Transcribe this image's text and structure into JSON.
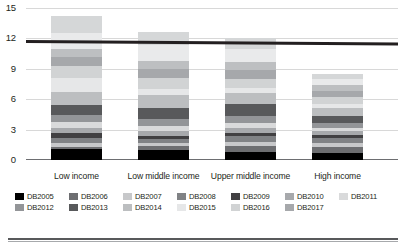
{
  "chart_data": {
    "type": "bar",
    "subtype": "stacked-bar",
    "title": "",
    "xlabel": "",
    "ylabel": "",
    "ylim": [
      0,
      15
    ],
    "yticks": [
      0,
      3,
      6,
      9,
      12,
      15
    ],
    "ytick_labels": [
      "0",
      "3",
      "6",
      "9",
      "12",
      "15"
    ],
    "grid": true,
    "legend_position": "bottom",
    "categories": [
      "Low income",
      "Low middle income",
      "Upper middle income",
      "High income"
    ],
    "series": [
      {
        "name": "DB2005",
        "color": "#000000",
        "values": [
          1.1,
          0.95,
          0.8,
          0.7
        ]
      },
      {
        "name": "DB2006",
        "color": "#6d6e71",
        "values": [
          0.2,
          0.45,
          0.6,
          0.55
        ]
      },
      {
        "name": "DB2007",
        "color": "#c7c8ca",
        "values": [
          0.4,
          0.25,
          0.35,
          0.45
        ]
      },
      {
        "name": "DB2008",
        "color": "#808285",
        "values": [
          0.5,
          0.4,
          0.6,
          0.45
        ]
      },
      {
        "name": "DB2009",
        "color": "#414042",
        "values": [
          0.5,
          0.35,
          0.35,
          0.3
        ]
      },
      {
        "name": "DB2010",
        "color": "#a7a9ac",
        "values": [
          0.5,
          0.45,
          0.5,
          0.4
        ]
      },
      {
        "name": "DB2011",
        "color": "#d9dadb",
        "values": [
          0.55,
          0.5,
          0.5,
          0.35
        ]
      },
      {
        "name": "DB2012",
        "color": "#939598",
        "values": [
          0.7,
          0.75,
          0.65,
          0.5
        ]
      },
      {
        "name": "DB2013",
        "color": "#58595b",
        "values": [
          0.95,
          1.05,
          1.2,
          0.65
        ]
      },
      {
        "name": "DB2014",
        "color": "#bcbec0",
        "values": [
          1.35,
          1.3,
          1.1,
          0.75
        ]
      },
      {
        "name": "DB2015",
        "color": "#e6e7e8",
        "values": [
          1.35,
          0.55,
          0.45,
          0.4
        ]
      },
      {
        "name": "DB2016",
        "color": "#d1d3d4",
        "values": [
          1.2,
          1.1,
          0.95,
          0.75
        ]
      },
      {
        "name": "DB2017",
        "color": "#a6a8ab",
        "values": [
          0.85,
          0.85,
          0.85,
          0.6
        ]
      },
      {
        "name": "DB2018",
        "color": "#bdbfc1",
        "values": [
          0.85,
          0.85,
          0.75,
          0.55
        ]
      },
      {
        "name": "DB2019",
        "color": "#e9eaeb",
        "values": [
          1.55,
          1.6,
          1.35,
          0.65
        ]
      },
      {
        "name": "DB2020",
        "color": "#d5d7d8",
        "values": [
          1.65,
          1.25,
          1.05,
          0.45
        ]
      }
    ],
    "totals": [
      14.25,
      13.65,
      12.75,
      8.0
    ],
    "reference_line": {
      "label": "",
      "value_start": 11.85,
      "value_end": 11.6,
      "color": "#231f20"
    }
  },
  "legend": {
    "rows": [
      [
        {
          "label": "DB2005",
          "color": "#000000"
        },
        {
          "label": "DB2006",
          "color": "#6d6e71"
        },
        {
          "label": "DB2007",
          "color": "#c7c8ca"
        },
        {
          "label": "DB2008",
          "color": "#808285"
        },
        {
          "label": "DB2009",
          "color": "#414042"
        },
        {
          "label": "DB2010",
          "color": "#a7a9ac"
        },
        {
          "label": "DB2011",
          "color": "#d9dadb"
        }
      ],
      [
        {
          "label": "DB2012",
          "color": "#939598"
        },
        {
          "label": "DB2013",
          "color": "#58595b"
        },
        {
          "label": "DB2014",
          "color": "#bcbec0"
        },
        {
          "label": "DB2015",
          "color": "#e6e7e8"
        },
        {
          "label": "DB2016",
          "color": "#d1d3d4"
        },
        {
          "label": "DB2017",
          "color": "#a6a8ab"
        }
      ]
    ]
  }
}
